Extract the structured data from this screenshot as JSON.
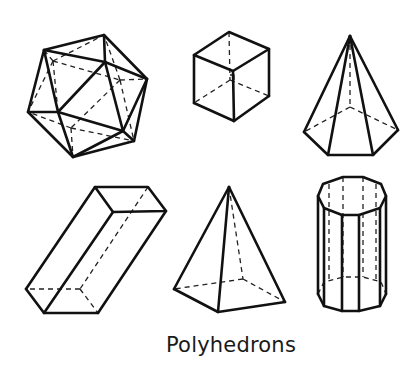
{
  "caption": "Polyhedrons",
  "colors": {
    "line": "#111111",
    "background": "#ffffff"
  },
  "figures": [
    {
      "id": "icosahedron",
      "label": "Icosahedron"
    },
    {
      "id": "cube",
      "label": "Cube"
    },
    {
      "id": "pentagonal-pyramid",
      "label": "Pentagonal pyramid"
    },
    {
      "id": "rectangular-prism",
      "label": "Rectangular prism"
    },
    {
      "id": "square-pyramid",
      "label": "Square pyramid"
    },
    {
      "id": "decagonal-prism",
      "label": "Decagonal prism"
    }
  ]
}
